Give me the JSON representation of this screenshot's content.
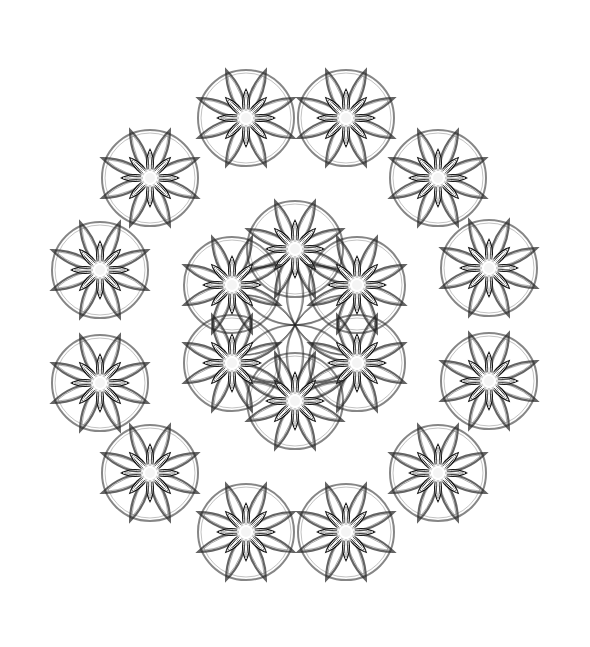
{
  "title": "Star rosette mandala pattern",
  "colors": {
    "background": "#ffffff",
    "ink": "#111111",
    "outline": "#222222",
    "highlight": "#ffffff"
  },
  "motif": {
    "petals": 8,
    "inner_petal_length": 30,
    "inner_petal_width": 10,
    "outer_petal_length": 52,
    "outer_petal_width": 22,
    "ring_radius": 48
  },
  "rings": [
    {
      "name": "inner-ring",
      "stars": [
        {
          "x": 295,
          "y": 249
        },
        {
          "x": 357,
          "y": 285
        },
        {
          "x": 357,
          "y": 363
        },
        {
          "x": 295,
          "y": 401
        },
        {
          "x": 232,
          "y": 363
        },
        {
          "x": 232,
          "y": 285
        }
      ]
    },
    {
      "name": "outer-ring",
      "stars": [
        {
          "x": 246,
          "y": 118
        },
        {
          "x": 346,
          "y": 118
        },
        {
          "x": 438,
          "y": 178
        },
        {
          "x": 489,
          "y": 268
        },
        {
          "x": 489,
          "y": 381
        },
        {
          "x": 438,
          "y": 473
        },
        {
          "x": 346,
          "y": 532
        },
        {
          "x": 246,
          "y": 532
        },
        {
          "x": 150,
          "y": 473
        },
        {
          "x": 100,
          "y": 383
        },
        {
          "x": 100,
          "y": 270
        },
        {
          "x": 150,
          "y": 178
        }
      ]
    }
  ],
  "center": {
    "x": 295,
    "y": 325,
    "lattice_radius": 60
  }
}
